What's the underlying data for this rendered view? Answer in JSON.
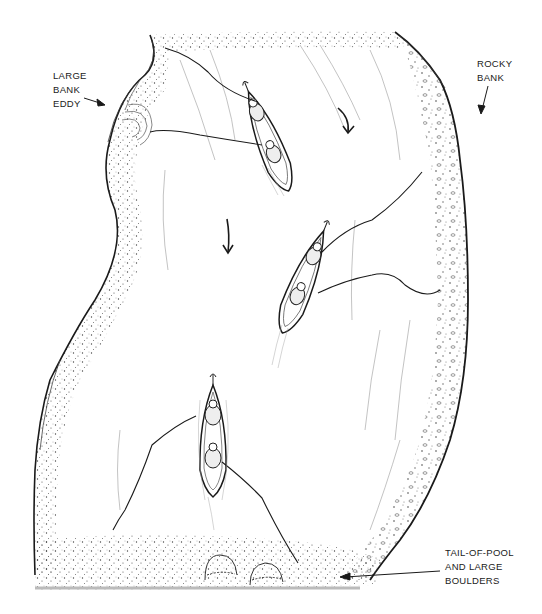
{
  "figure": {
    "colors": {
      "ink": "#1a1a1a",
      "paper": "#ffffff",
      "stipple": "#555555",
      "current_lines": "#9a9a9a"
    }
  },
  "labels": {
    "bank_eddy": {
      "lines": [
        "LARGE",
        "BANK",
        "EDDY"
      ],
      "arrow": "arrow-right"
    },
    "rocky_bank": {
      "lines": [
        "ROCKY",
        "BANK"
      ],
      "arrow": "arrow-down"
    },
    "tail_of_pool": {
      "lines": [
        "TAIL-OF-POOL",
        "AND LARGE",
        "BOULDERS"
      ],
      "arrow": "arrow-left"
    }
  },
  "current_arrows": [
    {
      "name": "current-arrow-upper",
      "direction": "down"
    },
    {
      "name": "current-arrow-middle",
      "direction": "down"
    }
  ],
  "canoes": [
    {
      "name": "canoe-upper",
      "anglers": 2
    },
    {
      "name": "canoe-middle",
      "anglers": 2
    },
    {
      "name": "canoe-lower",
      "anglers": 2
    }
  ],
  "boulders": 2
}
